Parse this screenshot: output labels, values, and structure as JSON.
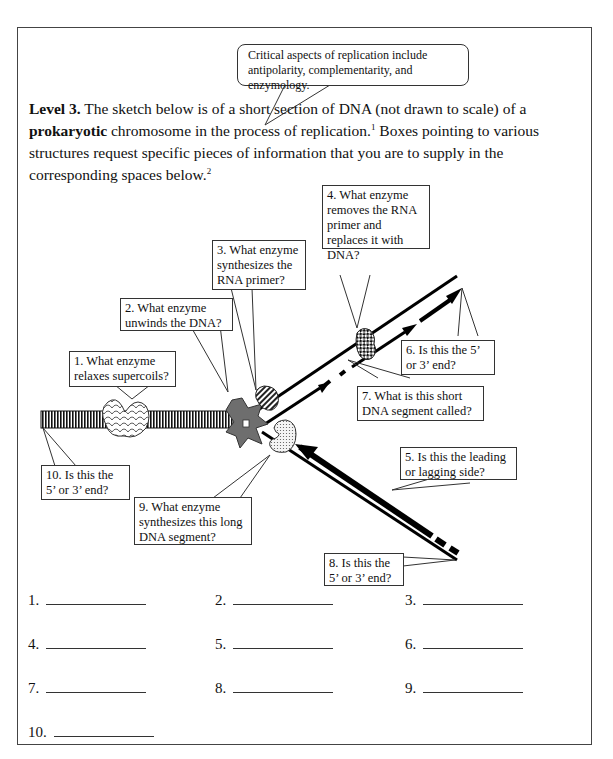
{
  "callout": {
    "text": "Critical aspects of replication include antipolarity, complementarity, and enzymology."
  },
  "intro": {
    "level_label": "Level 3.",
    "text_1": " The sketch below is of a short section of DNA (not drawn to scale) of a ",
    "bold_word": "prokaryotic",
    "text_2": " chromosome in the process of replication.",
    "footnote_1": "1",
    "text_3": "  Boxes pointing to various structures request specific pieces of information that you are to supply in the corresponding spaces below.",
    "footnote_2": "2"
  },
  "diagram": {
    "boxes": [
      {
        "id": 1,
        "text": "1. What enzyme relaxes supercoils?"
      },
      {
        "id": 2,
        "text": "2. What enzyme unwinds the DNA?"
      },
      {
        "id": 3,
        "text": "3. What enzyme synthesizes the RNA primer?"
      },
      {
        "id": 4,
        "text": "4. What enzyme removes the RNA primer and replaces it with DNA?"
      },
      {
        "id": 5,
        "text": "5.  Is this the leading or lagging side?"
      },
      {
        "id": 6,
        "text": "6.  Is this the 5’ or 3’ end?"
      },
      {
        "id": 7,
        "text": "7.  What is this short DNA segment called?"
      },
      {
        "id": 8,
        "text": "8.  Is this the 5’ or 3’ end?"
      },
      {
        "id": 9,
        "text": "9.  What enzyme synthesizes this long DNA segment?"
      },
      {
        "id": 10,
        "text": "10. Is this the 5’ or 3’ end?"
      }
    ],
    "colors": {
      "helicase": "#6e6e6e",
      "outline": "#222222",
      "strand": "#000000"
    }
  },
  "answers": {
    "items": [
      {
        "label": "1.",
        "value": ""
      },
      {
        "label": "2.",
        "value": ""
      },
      {
        "label": "3.",
        "value": ""
      },
      {
        "label": "4.",
        "value": ""
      },
      {
        "label": "5.",
        "value": ""
      },
      {
        "label": "6.",
        "value": ""
      },
      {
        "label": "7.",
        "value": ""
      },
      {
        "label": "8.",
        "value": ""
      },
      {
        "label": "9.",
        "value": ""
      },
      {
        "label": "10.",
        "value": ""
      }
    ]
  }
}
